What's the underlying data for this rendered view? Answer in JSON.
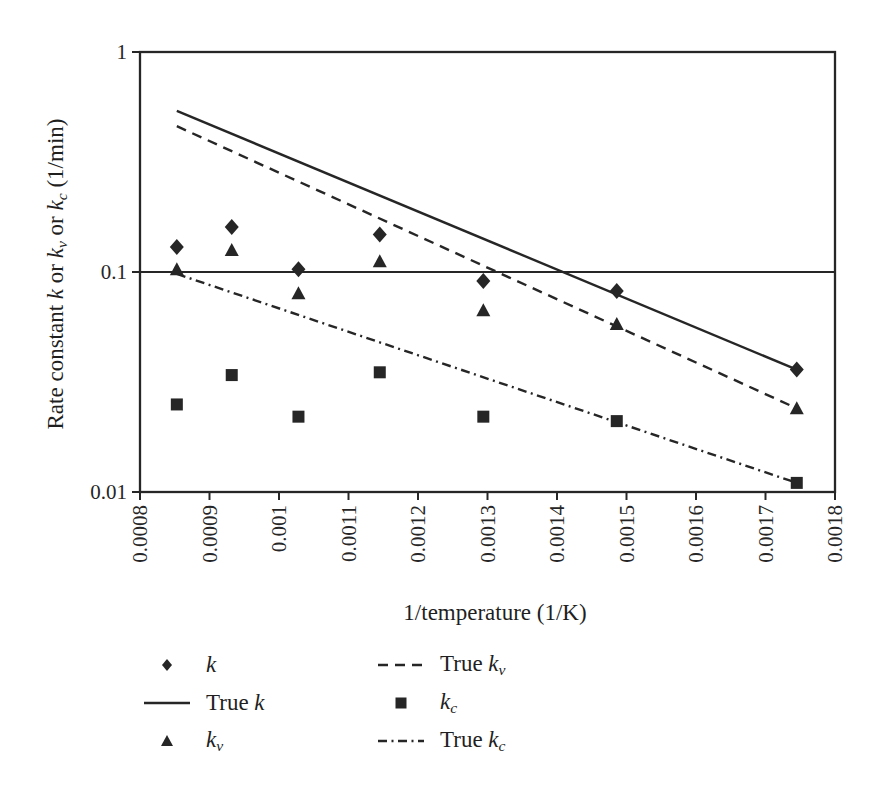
{
  "chart_data": {
    "type": "scatter",
    "title": "",
    "xlabel": "1/temperature (1/K)",
    "ylabel_parts": [
      {
        "t": "Rate constant "
      },
      {
        "t": "k",
        "i": true
      },
      {
        "t": " or "
      },
      {
        "t": "k",
        "i": true
      },
      {
        "t": "v",
        "i": true,
        "s": true
      },
      {
        "t": " or "
      },
      {
        "t": "k",
        "i": true
      },
      {
        "t": "c",
        "i": true,
        "s": true
      },
      {
        "t": " (1/min)"
      }
    ],
    "xlim": [
      0.0008,
      0.0018
    ],
    "ylim": [
      0.01,
      1
    ],
    "y_scale": "log",
    "grid": "horizontal-decades",
    "gridline_y": 0.1,
    "x_ticks": [
      {
        "v": 0.0008,
        "label": "0.0008"
      },
      {
        "v": 0.0009,
        "label": "0.0009"
      },
      {
        "v": 0.001,
        "label": "0.001"
      },
      {
        "v": 0.0011,
        "label": "0.0011"
      },
      {
        "v": 0.0012,
        "label": "0.0012"
      },
      {
        "v": 0.0013,
        "label": "0.0013"
      },
      {
        "v": 0.0014,
        "label": "0.0014"
      },
      {
        "v": 0.0015,
        "label": "0.0015"
      },
      {
        "v": 0.0016,
        "label": "0.0016"
      },
      {
        "v": 0.0017,
        "label": "0.0017"
      },
      {
        "v": 0.0018,
        "label": "0.0018"
      }
    ],
    "y_ticks": [
      {
        "v": 1,
        "label": "1"
      },
      {
        "v": 0.1,
        "label": "0.1"
      },
      {
        "v": 0.01,
        "label": "0.01"
      }
    ],
    "x_values": [
      0.000853,
      0.000932,
      0.001028,
      0.001145,
      0.001294,
      0.001486,
      0.001745
    ],
    "series": [
      {
        "name": "k",
        "kind": "scatter",
        "marker": "diamond",
        "label_parts": [
          {
            "t": "k",
            "i": true
          }
        ],
        "y": [
          0.13,
          0.16,
          0.103,
          0.148,
          0.091,
          0.082,
          0.036
        ]
      },
      {
        "name": "true-k",
        "kind": "line",
        "style": "solid",
        "label_parts": [
          {
            "t": "True "
          },
          {
            "t": "k",
            "i": true
          }
        ],
        "x": [
          0.000853,
          0.001745
        ],
        "y": [
          0.54,
          0.036
        ]
      },
      {
        "name": "kv",
        "kind": "scatter",
        "marker": "triangle",
        "label_parts": [
          {
            "t": "k",
            "i": true
          },
          {
            "t": "v",
            "i": true,
            "s": true
          }
        ],
        "y": [
          0.103,
          0.126,
          0.08,
          0.112,
          0.067,
          0.058,
          0.024
        ]
      },
      {
        "name": "true-kv",
        "kind": "line",
        "style": "dashed",
        "label_parts": [
          {
            "t": "True "
          },
          {
            "t": "k",
            "i": true
          },
          {
            "t": "v",
            "i": true,
            "s": true
          }
        ],
        "x": [
          0.000853,
          0.001745
        ],
        "y": [
          0.46,
          0.024
        ]
      },
      {
        "name": "kc",
        "kind": "scatter",
        "marker": "square",
        "label_parts": [
          {
            "t": "k",
            "i": true
          },
          {
            "t": "c",
            "i": true,
            "s": true
          }
        ],
        "y": [
          0.025,
          0.034,
          0.022,
          0.035,
          0.022,
          0.021,
          0.011
        ]
      },
      {
        "name": "true-kc",
        "kind": "line",
        "style": "dashdot",
        "label_parts": [
          {
            "t": "True "
          },
          {
            "t": "k",
            "i": true
          },
          {
            "t": "c",
            "i": true,
            "s": true
          }
        ],
        "x": [
          0.000853,
          0.001745
        ],
        "y": [
          0.098,
          0.011
        ]
      }
    ],
    "legend": {
      "position": "bottom",
      "columns": [
        [
          "k",
          "true-k",
          "kv"
        ],
        [
          "true-kv",
          "kc",
          "true-kc"
        ]
      ]
    },
    "colors": {
      "ink": "#262626",
      "background": "#ffffff"
    }
  }
}
